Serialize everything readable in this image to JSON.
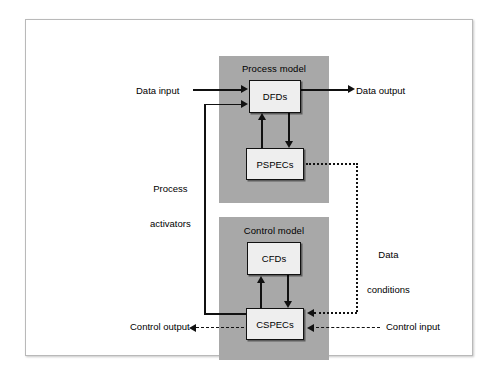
{
  "diagram": {
    "panels": {
      "process_model": {
        "title": "Process model"
      },
      "control_model": {
        "title": "Control model"
      }
    },
    "nodes": {
      "dfds": "DFDs",
      "pspecs": "PSPECs",
      "cfds": "CFDs",
      "cspecs": "CSPECs"
    },
    "labels": {
      "data_input": "Data input",
      "data_output": "Data output",
      "process_activators_line1": "Process",
      "process_activators_line2": "activators",
      "data_conditions_line1": "Data",
      "data_conditions_line2": "conditions",
      "control_output": "Control output",
      "control_input": "Control input"
    },
    "colors": {
      "panel_fill": "#a8a8a8",
      "node_fill": "#eeeeee",
      "stroke": "#111111",
      "page_background": "#ffffff",
      "frame_border": "#b9b9b9"
    }
  }
}
